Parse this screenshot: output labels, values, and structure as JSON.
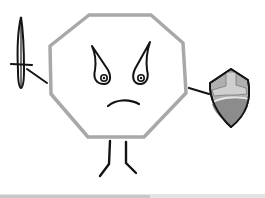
{
  "illustration": {
    "subject": "Angry octagon character holding a sword and a shield",
    "character": {
      "shape": "octagon",
      "expression": "angry",
      "outline_color": "#a8a8a8",
      "fill_color": "#ffffff"
    },
    "sword": {
      "color": "#1a1a1a"
    },
    "shield": {
      "main_color": "#b0b0b0",
      "dark_color": "#8c8c8c",
      "highlight_color": "#e6e6e6",
      "outline_color": "#1a1a1a"
    },
    "ink_color": "#141414",
    "background": "#ffffff",
    "bottom_shadow": "#d8d8d8"
  }
}
